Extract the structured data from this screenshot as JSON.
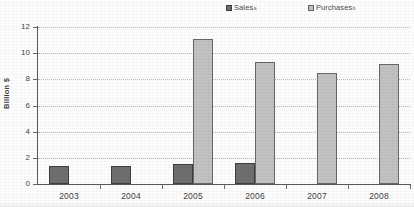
{
  "chart_data": {
    "type": "bar",
    "title": "",
    "xlabel": "",
    "ylabel": "Billion $",
    "categories": [
      "2003",
      "2004",
      "2005",
      "2006",
      "2007",
      "2008"
    ],
    "ylim": [
      0,
      12
    ],
    "ytick_labels": [
      "0",
      "2",
      "4",
      "6",
      "8",
      "10",
      "12"
    ],
    "ytick_values": [
      0,
      2,
      4,
      6,
      8,
      10,
      12
    ],
    "grid": "horizontal-dotted",
    "legend_position": "top",
    "series": [
      {
        "name": "Sales",
        "footnote_marker": "a",
        "color": "#6f6f6f",
        "values": [
          1.4,
          1.4,
          1.5,
          1.6,
          null,
          null
        ]
      },
      {
        "name": "Purchases",
        "footnote_marker": "b",
        "color": "#c2c2c2",
        "values": [
          null,
          null,
          11.1,
          9.3,
          8.5,
          9.2
        ]
      }
    ]
  },
  "legend": {
    "entries": [
      {
        "label": "Sales",
        "marker": "a"
      },
      {
        "label": "Purchases",
        "marker": "b"
      }
    ]
  },
  "axes": {
    "y_title": "Billion $"
  }
}
